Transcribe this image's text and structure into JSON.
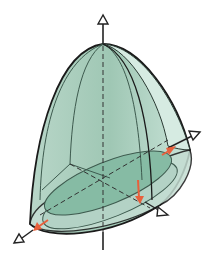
{
  "diagram": {
    "type": "3d-solid-paraboloid",
    "colors": {
      "background": "#ffffff",
      "solid_fill": "#9fc7b4",
      "solid_fill_light": "#cfe6dc",
      "base_fill": "#b9d6ca",
      "inner_slice_fill": "#7fb8a0",
      "outline": "#1a1a1a",
      "inner_lines": "#3d5a4e",
      "red_arrow": "#e8603c",
      "axis": "#222222"
    },
    "axes": [
      {
        "name": "vertical-axis",
        "arrow": "up"
      },
      {
        "name": "x-axis-right",
        "arrow": "upper-right"
      },
      {
        "name": "y-axis-lower-right",
        "arrow": "lower-right"
      },
      {
        "name": "z-axis-lower-left",
        "arrow": "lower-left"
      }
    ],
    "red_arrows": 3
  }
}
